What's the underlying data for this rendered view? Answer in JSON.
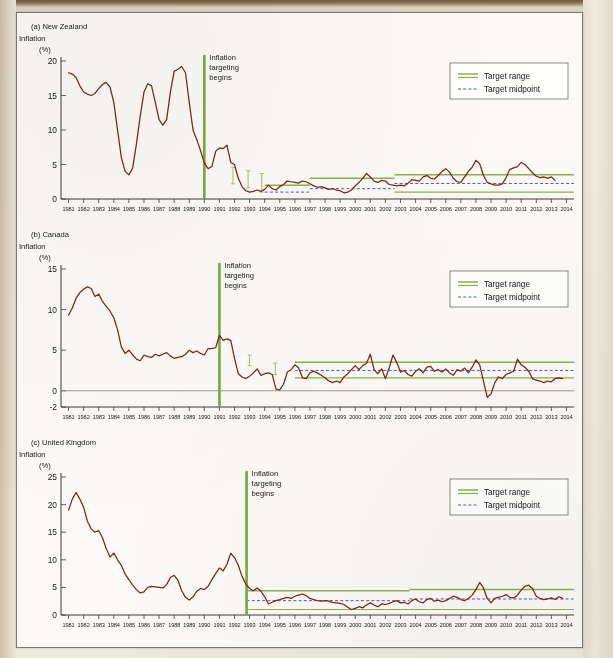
{
  "figure": {
    "background_color": "#efe9dc",
    "paper_color": "#fbfaf6",
    "series_color": "#7d2518",
    "target_color": "#8cb34a",
    "midpoint_color": "#3b4f9e",
    "event_color": "#7ba83f"
  },
  "legend": {
    "range_label": "Target range",
    "midpoint_label": "Target midpoint"
  },
  "annotations": {
    "event_line1": "Inflation",
    "event_line2": "targeting",
    "event_line3": "begins"
  },
  "axis": {
    "y_title": "Inflation",
    "y_unit": "(%)",
    "x_years": [
      1981,
      1982,
      1983,
      1984,
      1985,
      1986,
      1987,
      1988,
      1989,
      1990,
      1991,
      1992,
      1993,
      1994,
      1995,
      1996,
      1997,
      1998,
      1999,
      2000,
      2001,
      2002,
      2003,
      2004,
      2005,
      2006,
      2007,
      2008,
      2009,
      2010,
      2011,
      2012,
      2013,
      2014
    ]
  },
  "chart_data": [
    {
      "type": "line",
      "panel": "a",
      "title": "(a) New Zealand",
      "ylabel": "Inflation (%)",
      "xlabel": "",
      "ylim": [
        0,
        20
      ],
      "yticks": [
        0,
        5,
        10,
        15,
        20
      ],
      "xlim": [
        1980.5,
        2014.5
      ],
      "grid": false,
      "legend_position": "top-right",
      "event_year": 1990.0,
      "event_label": "Inflation targeting begins",
      "target_bands": [
        {
          "from": 1994.0,
          "to": 1997.0,
          "low": 0.0,
          "high": 2.0
        },
        {
          "from": 1997.0,
          "to": 2002.6,
          "low": 0.0,
          "high": 3.0
        },
        {
          "from": 2002.6,
          "to": 2014.5,
          "low": 1.0,
          "high": 3.5
        }
      ],
      "midpoint_segments": [
        {
          "from": 1994.0,
          "to": 1997.0,
          "value": 1.0
        },
        {
          "from": 1997.0,
          "to": 2002.6,
          "value": 1.5
        },
        {
          "from": 2002.6,
          "to": 2014.5,
          "value": 2.25
        }
      ],
      "error_bars": [
        {
          "x": 1991.9,
          "low": 2.2,
          "high": 4.6
        },
        {
          "x": 1992.9,
          "low": 1.6,
          "high": 4.1
        },
        {
          "x": 1993.8,
          "low": 1.0,
          "high": 3.7
        }
      ],
      "x": [
        1981.0,
        1981.25,
        1981.5,
        1981.75,
        1982.0,
        1982.25,
        1982.5,
        1982.75,
        1983.0,
        1983.25,
        1983.5,
        1983.75,
        1984.0,
        1984.25,
        1984.5,
        1984.75,
        1985.0,
        1985.25,
        1985.5,
        1985.75,
        1986.0,
        1986.25,
        1986.5,
        1986.75,
        1987.0,
        1987.25,
        1987.5,
        1987.75,
        1988.0,
        1988.25,
        1988.5,
        1988.75,
        1989.0,
        1989.25,
        1989.5,
        1989.75,
        1990.0,
        1990.25,
        1990.5,
        1990.75,
        1991.0,
        1991.25,
        1991.5,
        1991.75,
        1992.0,
        1992.25,
        1992.5,
        1992.75,
        1993.0,
        1993.25,
        1993.5,
        1993.75,
        1994.0,
        1994.25,
        1994.5,
        1994.75,
        1995.0,
        1995.25,
        1995.5,
        1995.75,
        1996.0,
        1996.25,
        1996.5,
        1996.75,
        1997.0,
        1997.25,
        1997.5,
        1997.75,
        1998.0,
        1998.25,
        1998.5,
        1998.75,
        1999.0,
        1999.25,
        1999.5,
        1999.75,
        2000.0,
        2000.25,
        2000.5,
        2000.75,
        2001.0,
        2001.25,
        2001.5,
        2001.75,
        2002.0,
        2002.25,
        2002.5,
        2002.75,
        2003.0,
        2003.25,
        2003.5,
        2003.75,
        2004.0,
        2004.25,
        2004.5,
        2004.75,
        2005.0,
        2005.25,
        2005.5,
        2005.75,
        2006.0,
        2006.25,
        2006.5,
        2006.75,
        2007.0,
        2007.25,
        2007.5,
        2007.75,
        2008.0,
        2008.25,
        2008.5,
        2008.75,
        2009.0,
        2009.25,
        2009.5,
        2009.75,
        2010.0,
        2010.25,
        2010.5,
        2010.75,
        2011.0,
        2011.25,
        2011.5,
        2011.75,
        2012.0,
        2012.25,
        2012.5,
        2012.75,
        2013.0,
        2013.25,
        2013.5,
        2013.75,
        2014.0,
        2014.25
      ],
      "y": [
        18.3,
        18.1,
        17.6,
        16.4,
        15.5,
        15.2,
        15.0,
        15.3,
        16.0,
        16.6,
        16.9,
        16.2,
        14.0,
        10.0,
        6.0,
        4.0,
        3.5,
        4.5,
        8.0,
        12.0,
        15.5,
        16.7,
        16.4,
        14.0,
        11.5,
        10.7,
        11.5,
        15.5,
        18.5,
        18.8,
        19.2,
        18.3,
        14.0,
        10.0,
        8.6,
        7.0,
        5.2,
        4.4,
        4.7,
        6.9,
        7.4,
        7.3,
        7.8,
        5.3,
        5.0,
        3.0,
        1.8,
        1.2,
        1.0,
        1.1,
        1.3,
        1.1,
        1.4,
        2.0,
        1.5,
        1.3,
        1.8,
        2.1,
        2.6,
        2.5,
        2.4,
        2.3,
        2.6,
        2.5,
        2.2,
        1.9,
        1.7,
        1.8,
        1.6,
        1.4,
        1.5,
        1.3,
        1.2,
        0.9,
        1.0,
        1.3,
        1.9,
        2.4,
        3.0,
        3.7,
        3.2,
        2.6,
        2.4,
        2.7,
        2.6,
        2.1,
        2.0,
        1.9,
        2.0,
        1.9,
        2.3,
        2.8,
        2.7,
        2.6,
        3.2,
        3.4,
        3.0,
        2.9,
        3.4,
        4.0,
        4.4,
        3.9,
        3.0,
        2.5,
        2.4,
        3.2,
        4.0,
        4.6,
        5.6,
        5.1,
        3.4,
        2.4,
        2.2,
        2.0,
        2.0,
        2.2,
        3.1,
        4.3,
        4.5,
        4.7,
        5.3,
        5.0,
        4.4,
        3.8,
        3.3,
        3.1,
        3.2,
        3.0,
        3.2,
        2.7
      ]
    },
    {
      "type": "line",
      "panel": "b",
      "title": "(b) Canada",
      "ylabel": "Inflation (%)",
      "xlabel": "",
      "ylim": [
        -2,
        15
      ],
      "yticks": [
        -2,
        0,
        5,
        10,
        15
      ],
      "xlim": [
        1980.5,
        2014.5
      ],
      "grid": false,
      "legend_position": "top-right",
      "event_year": 1991.0,
      "event_label": "Inflation targeting begins",
      "target_bands": [
        {
          "from": 1996.0,
          "to": 2014.5,
          "low": 1.6,
          "high": 3.5
        }
      ],
      "midpoint_segments": [
        {
          "from": 1996.0,
          "to": 2014.5,
          "value": 2.5
        }
      ],
      "error_bars": [
        {
          "x": 1993.0,
          "low": 3.1,
          "high": 4.4
        },
        {
          "x": 1994.7,
          "low": 2.0,
          "high": 3.4
        }
      ],
      "x": [
        1981.0,
        1981.25,
        1981.5,
        1981.75,
        1982.0,
        1982.25,
        1982.5,
        1982.75,
        1983.0,
        1983.25,
        1983.5,
        1983.75,
        1984.0,
        1984.25,
        1984.5,
        1984.75,
        1985.0,
        1985.25,
        1985.5,
        1985.75,
        1986.0,
        1986.25,
        1986.5,
        1986.75,
        1987.0,
        1987.25,
        1987.5,
        1987.75,
        1988.0,
        1988.25,
        1988.5,
        1988.75,
        1989.0,
        1989.25,
        1989.5,
        1989.75,
        1990.0,
        1990.25,
        1990.5,
        1990.75,
        1991.0,
        1991.25,
        1991.5,
        1991.75,
        1992.0,
        1992.25,
        1992.5,
        1992.75,
        1993.0,
        1993.25,
        1993.5,
        1993.75,
        1994.0,
        1994.25,
        1994.5,
        1994.75,
        1995.0,
        1995.25,
        1995.5,
        1995.75,
        1996.0,
        1996.25,
        1996.5,
        1996.75,
        1997.0,
        1997.25,
        1997.5,
        1997.75,
        1998.0,
        1998.25,
        1998.5,
        1998.75,
        1999.0,
        1999.25,
        1999.5,
        1999.75,
        2000.0,
        2000.25,
        2000.5,
        2000.75,
        2001.0,
        2001.25,
        2001.5,
        2001.75,
        2002.0,
        2002.25,
        2002.5,
        2002.75,
        2003.0,
        2003.25,
        2003.5,
        2003.75,
        2004.0,
        2004.25,
        2004.5,
        2004.75,
        2005.0,
        2005.25,
        2005.5,
        2005.75,
        2006.0,
        2006.25,
        2006.5,
        2006.75,
        2007.0,
        2007.25,
        2007.5,
        2007.75,
        2008.0,
        2008.25,
        2008.5,
        2008.75,
        2009.0,
        2009.25,
        2009.5,
        2009.75,
        2010.0,
        2010.25,
        2010.5,
        2010.75,
        2011.0,
        2011.25,
        2011.5,
        2011.75,
        2012.0,
        2012.25,
        2012.5,
        2012.75,
        2013.0,
        2013.25,
        2013.5,
        2013.75,
        2014.0,
        2014.25
      ],
      "y": [
        9.3,
        10.2,
        11.4,
        12.1,
        12.5,
        12.8,
        12.6,
        11.6,
        11.9,
        11.0,
        10.4,
        9.8,
        9.0,
        7.5,
        5.4,
        4.6,
        5.0,
        4.4,
        3.9,
        3.7,
        4.4,
        4.2,
        4.1,
        4.5,
        4.3,
        4.5,
        4.7,
        4.3,
        4.0,
        4.1,
        4.2,
        4.5,
        5.0,
        4.7,
        4.9,
        4.6,
        4.4,
        5.2,
        5.2,
        5.3,
        6.8,
        6.2,
        6.4,
        6.2,
        4.0,
        2.1,
        1.7,
        1.5,
        1.8,
        2.2,
        2.7,
        1.9,
        2.1,
        2.2,
        2.0,
        0.2,
        0.1,
        0.8,
        2.3,
        2.6,
        3.2,
        2.8,
        1.6,
        1.5,
        2.2,
        2.4,
        2.2,
        1.9,
        1.6,
        1.2,
        1.0,
        1.2,
        1.0,
        1.7,
        2.1,
        2.6,
        3.1,
        2.6,
        3.1,
        3.4,
        4.5,
        2.6,
        2.1,
        2.7,
        1.5,
        2.8,
        4.4,
        3.5,
        2.3,
        2.5,
        2.0,
        1.8,
        2.4,
        2.7,
        2.2,
        2.9,
        3.0,
        2.4,
        2.6,
        2.3,
        2.7,
        2.2,
        1.9,
        2.6,
        2.4,
        2.8,
        2.2,
        2.9,
        3.8,
        3.2,
        1.2,
        -0.8,
        -0.4,
        1.0,
        1.7,
        1.5,
        2.0,
        2.2,
        2.4,
        3.9,
        3.2,
        2.9,
        2.4,
        1.5,
        1.3,
        1.2,
        1.0,
        1.2,
        1.1,
        1.5,
        1.6,
        1.5
      ]
    },
    {
      "type": "line",
      "panel": "c",
      "title": "(c) United Kingdom",
      "ylabel": "Inflation (%)",
      "xlabel": "",
      "ylim": [
        0,
        25
      ],
      "yticks": [
        0,
        5,
        10,
        15,
        20,
        25
      ],
      "xlim": [
        1980.5,
        2014.5
      ],
      "grid": false,
      "legend_position": "top-right",
      "event_year": 1992.8,
      "event_label": "Inflation targeting begins",
      "target_bands": [
        {
          "from": 1992.8,
          "to": 2003.6,
          "low": 1.0,
          "high": 4.4
        },
        {
          "from": 2003.6,
          "to": 2014.5,
          "low": 1.0,
          "high": 4.6
        }
      ],
      "midpoint_segments": [
        {
          "from": 1992.8,
          "to": 2003.6,
          "value": 2.6
        },
        {
          "from": 2003.6,
          "to": 2014.5,
          "value": 2.9
        }
      ],
      "error_bars": [],
      "x": [
        1981.0,
        1981.25,
        1981.5,
        1981.75,
        1982.0,
        1982.25,
        1982.5,
        1982.75,
        1983.0,
        1983.25,
        1983.5,
        1983.75,
        1984.0,
        1984.25,
        1984.5,
        1984.75,
        1985.0,
        1985.25,
        1985.5,
        1985.75,
        1986.0,
        1986.25,
        1986.5,
        1986.75,
        1987.0,
        1987.25,
        1987.5,
        1987.75,
        1988.0,
        1988.25,
        1988.5,
        1988.75,
        1989.0,
        1989.25,
        1989.5,
        1989.75,
        1990.0,
        1990.25,
        1990.5,
        1990.75,
        1991.0,
        1991.25,
        1991.5,
        1991.75,
        1992.0,
        1992.25,
        1992.5,
        1992.75,
        1993.0,
        1993.25,
        1993.5,
        1993.75,
        1994.0,
        1994.25,
        1994.5,
        1994.75,
        1995.0,
        1995.25,
        1995.5,
        1995.75,
        1996.0,
        1996.25,
        1996.5,
        1996.75,
        1997.0,
        1997.25,
        1997.5,
        1997.75,
        1998.0,
        1998.25,
        1998.5,
        1998.75,
        1999.0,
        1999.25,
        1999.5,
        1999.75,
        2000.0,
        2000.25,
        2000.5,
        2000.75,
        2001.0,
        2001.25,
        2001.5,
        2001.75,
        2002.0,
        2002.25,
        2002.5,
        2002.75,
        2003.0,
        2003.25,
        2003.5,
        2003.75,
        2004.0,
        2004.25,
        2004.5,
        2004.75,
        2005.0,
        2005.25,
        2005.5,
        2005.75,
        2006.0,
        2006.25,
        2006.5,
        2006.75,
        2007.0,
        2007.25,
        2007.5,
        2007.75,
        2008.0,
        2008.25,
        2008.5,
        2008.75,
        2009.0,
        2009.25,
        2009.5,
        2009.75,
        2010.0,
        2010.25,
        2010.5,
        2010.75,
        2011.0,
        2011.25,
        2011.5,
        2011.75,
        2012.0,
        2012.25,
        2012.5,
        2012.75,
        2013.0,
        2013.25,
        2013.5,
        2013.75,
        2014.0,
        2014.25
      ],
      "y": [
        19.0,
        21.0,
        22.2,
        21.0,
        19.5,
        17.0,
        15.6,
        15.0,
        15.3,
        14.0,
        12.0,
        10.5,
        11.2,
        10.0,
        9.0,
        7.4,
        6.4,
        5.4,
        4.6,
        4.0,
        4.2,
        5.0,
        5.2,
        5.1,
        5.0,
        4.9,
        5.5,
        6.8,
        7.2,
        6.3,
        4.4,
        3.2,
        2.7,
        3.3,
        4.3,
        4.8,
        4.6,
        5.2,
        6.4,
        7.5,
        8.5,
        8.0,
        9.2,
        11.2,
        10.4,
        9.0,
        7.0,
        5.6,
        4.8,
        4.4,
        4.9,
        4.3,
        3.3,
        2.0,
        2.3,
        2.6,
        2.8,
        3.0,
        3.2,
        3.0,
        3.4,
        3.6,
        3.8,
        3.5,
        3.0,
        2.8,
        2.6,
        2.5,
        2.6,
        2.5,
        2.3,
        2.2,
        2.1,
        1.9,
        1.4,
        1.0,
        1.2,
        1.5,
        1.3,
        1.8,
        2.2,
        1.8,
        1.5,
        2.0,
        1.9,
        2.1,
        2.4,
        2.6,
        2.2,
        2.3,
        2.0,
        2.6,
        2.9,
        2.4,
        2.2,
        2.8,
        3.0,
        2.5,
        2.7,
        2.4,
        2.6,
        3.0,
        3.4,
        3.2,
        2.8,
        2.6,
        3.0,
        3.6,
        4.6,
        5.9,
        4.9,
        3.0,
        2.2,
        3.0,
        3.2,
        3.4,
        3.7,
        3.2,
        3.1,
        3.6,
        4.5,
        5.2,
        5.4,
        4.8,
        3.4,
        3.0,
        2.8,
        2.9,
        3.1,
        2.8,
        3.3,
        3.0
      ]
    }
  ]
}
